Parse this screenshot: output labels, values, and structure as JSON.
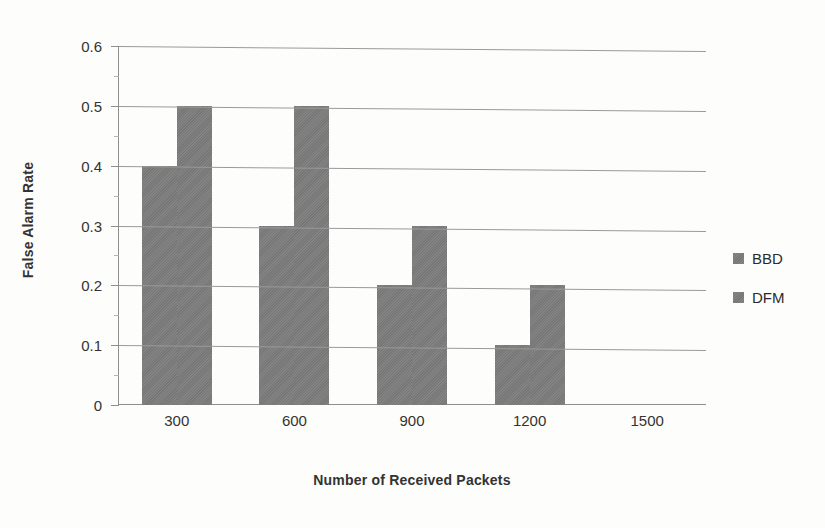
{
  "chart_data": {
    "type": "bar",
    "title": "",
    "xlabel": "Number of Received Packets",
    "ylabel": "False Alarm Rate",
    "categories": [
      "300",
      "600",
      "900",
      "1200",
      "1500"
    ],
    "series": [
      {
        "name": "BBD",
        "values": [
          0.4,
          0.3,
          0.2,
          0.1,
          0
        ]
      },
      {
        "name": "DFM",
        "values": [
          0.5,
          0.5,
          0.3,
          0.2,
          0
        ]
      }
    ],
    "ylim": [
      0,
      0.6
    ],
    "ytick_labels": [
      "0.6",
      "0.5",
      "0.4",
      "0.3",
      "0.2",
      "0.1",
      "0"
    ],
    "ytick_values": [
      0.6,
      0.5,
      0.4,
      0.3,
      0.2,
      0.1,
      0
    ],
    "grid": true,
    "legend_position": "right",
    "bar_color": "#7c7c7c",
    "grid_color": "#9a9a9a",
    "axis_color": "#8f8f8f",
    "background": "#fdfdfb"
  }
}
